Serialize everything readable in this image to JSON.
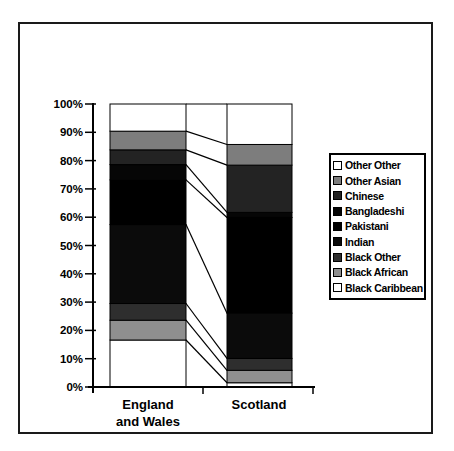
{
  "chart_data": {
    "type": "bar",
    "variant": "100-percent-stacked-column",
    "title": "",
    "xlabel": "",
    "ylabel": "",
    "categories": [
      "England and Wales",
      "Scotland"
    ],
    "x_tick_lines": [
      [
        "England",
        "and Wales"
      ],
      [
        "Scotland"
      ]
    ],
    "series": [
      {
        "name": "Black Caribbean",
        "values": [
          16.6,
          1.5
        ],
        "color": "#ffffff"
      },
      {
        "name": "Black African",
        "values": [
          7.0,
          4.4
        ],
        "color": "#8f8f8f"
      },
      {
        "name": "Black Other",
        "values": [
          5.9,
          4.2
        ],
        "color": "#2e2e2e"
      },
      {
        "name": "Indian",
        "values": [
          27.9,
          16.0
        ],
        "color": "#0b0b0b"
      },
      {
        "name": "Pakistani",
        "values": [
          15.8,
          33.8
        ],
        "color": "#000000"
      },
      {
        "name": "Bangladeshi",
        "values": [
          5.4,
          1.8
        ],
        "color": "#060606"
      },
      {
        "name": "Chinese",
        "values": [
          5.2,
          16.7
        ],
        "color": "#232323"
      },
      {
        "name": "Other Asian",
        "values": [
          6.6,
          7.3
        ],
        "color": "#7d7d7d"
      },
      {
        "name": "Other Other",
        "values": [
          9.6,
          14.3
        ],
        "color": "#ffffff"
      }
    ],
    "y_ticks": [
      "0%",
      "10%",
      "20%",
      "30%",
      "40%",
      "50%",
      "60%",
      "70%",
      "80%",
      "90%",
      "100%"
    ],
    "ylim": [
      0,
      100
    ],
    "grid": false,
    "series_lines": true,
    "legend_position": "right",
    "legend_order_top_to_bottom": [
      "Other Other",
      "Other Asian",
      "Chinese",
      "Bangladeshi",
      "Pakistani",
      "Indian",
      "Black Other",
      "Black African",
      "Black Caribbean"
    ]
  },
  "colors": {
    "axis": "#000000",
    "border": "#1a1a1a",
    "background": "#ffffff",
    "segment_outline": "#000000"
  }
}
